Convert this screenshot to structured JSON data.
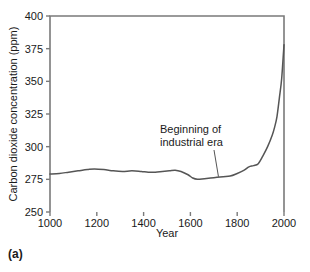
{
  "figure": {
    "panel_label": "(a)",
    "background_color": "#ffffff",
    "axis_color": "#7a7a7a",
    "line_color": "#555555",
    "text_color": "#1a1a1a"
  },
  "chart_data": {
    "type": "line",
    "title": "",
    "xlabel": "Year",
    "ylabel": "Carbon dioxide concentration (ppm)",
    "xlim": [
      1000,
      2000
    ],
    "ylim": [
      250,
      400
    ],
    "xticks": [
      1000,
      1200,
      1400,
      1600,
      1800,
      2000
    ],
    "yticks": [
      250,
      275,
      300,
      325,
      350,
      375,
      400
    ],
    "grid": false,
    "legend": null,
    "series": [
      {
        "name": "Atmospheric CO2",
        "x": [
          1000,
          1040,
          1080,
          1120,
          1160,
          1190,
          1230,
          1270,
          1310,
          1350,
          1390,
          1420,
          1450,
          1480,
          1510,
          1535,
          1560,
          1590,
          1610,
          1630,
          1660,
          1700,
          1740,
          1770,
          1800,
          1830,
          1850,
          1870,
          1890,
          1910,
          1930,
          1950,
          1960,
          1970,
          1980,
          1990,
          2000
        ],
        "values": [
          279.0,
          279.5,
          280.5,
          281.5,
          282.5,
          283.0,
          282.5,
          281.5,
          281.0,
          281.5,
          281.0,
          280.5,
          280.5,
          281.0,
          281.5,
          282.0,
          281.0,
          278.5,
          276.0,
          275.0,
          275.5,
          276.3,
          277.0,
          277.5,
          279.5,
          282.0,
          284.5,
          285.5,
          287.0,
          293.0,
          300.0,
          309.0,
          315.0,
          323.0,
          337.0,
          352.0,
          378.0
        ]
      }
    ],
    "annotations": [
      {
        "text_line_1": "Beginning of",
        "text_line_2": "industrial era",
        "pointer_target_year": 1720,
        "pointer_target_value": 277
      }
    ]
  }
}
